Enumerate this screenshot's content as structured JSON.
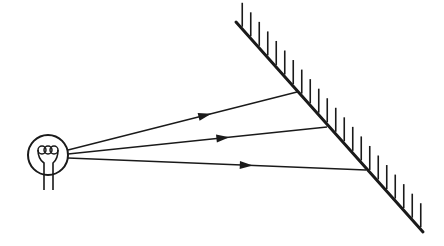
{
  "diagram": {
    "title": "",
    "colors": {
      "ink": "#1a1a1a",
      "background": "#ffffff"
    },
    "source": {
      "type": "light-bulb",
      "cx": 48,
      "cy": 155,
      "r": 20
    },
    "mirror": {
      "x1": 236,
      "y1": 22,
      "x2": 423,
      "y2": 232,
      "hatch_count": 22,
      "hatch_length": 24
    },
    "rays": [
      {
        "x1": 68,
        "y1": 150,
        "x2": 297,
        "y2": 92,
        "arrow_t": 0.6
      },
      {
        "x1": 68,
        "y1": 154,
        "x2": 327,
        "y2": 127,
        "arrow_t": 0.6
      },
      {
        "x1": 68,
        "y1": 158,
        "x2": 366,
        "y2": 170,
        "arrow_t": 0.6
      }
    ]
  }
}
